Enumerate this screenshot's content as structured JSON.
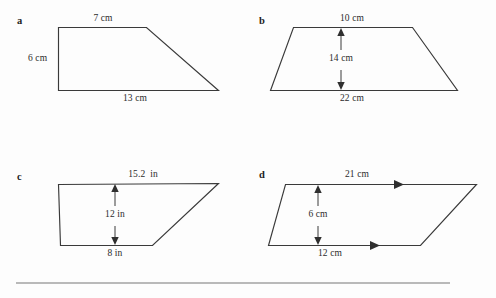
{
  "page": {
    "background_color": "#fdfdfd",
    "stroke_color": "#3a3a3a",
    "rule_color": "#b9b9b9"
  },
  "figures": [
    {
      "key": "a",
      "letter": "a",
      "shape_type": "trapezoid",
      "description": "right trapezoid with vertical left side",
      "labels": {
        "top": "7 cm",
        "left": "6 cm",
        "bottom": "13 cm"
      },
      "measurements": [
        {
          "name": "top-side",
          "value": 7,
          "unit": "cm",
          "text": "7 cm"
        },
        {
          "name": "left-side",
          "value": 6,
          "unit": "cm",
          "text": "6 cm"
        },
        {
          "name": "bottom-side",
          "value": 13,
          "unit": "cm",
          "text": "13 cm"
        }
      ]
    },
    {
      "key": "b",
      "letter": "b",
      "shape_type": "trapezoid",
      "description": "isosceles trapezoid with interior height arrow",
      "labels": {
        "top": "10 cm",
        "height": "14 cm",
        "bottom": "22 cm"
      },
      "measurements": [
        {
          "name": "top-side",
          "value": 10,
          "unit": "cm",
          "text": "10 cm"
        },
        {
          "name": "height",
          "value": 14,
          "unit": "cm",
          "text": "14 cm"
        },
        {
          "name": "bottom-side",
          "value": 22,
          "unit": "cm",
          "text": "22 cm"
        }
      ]
    },
    {
      "key": "c",
      "letter": "c",
      "shape_type": "trapezoid",
      "description": "trapezoid with long top side and interior height arrow",
      "labels": {
        "top": "15.2  in",
        "height": "12 in",
        "bottom": "8 in"
      },
      "measurements": [
        {
          "name": "top-side",
          "value": 15.2,
          "unit": "in",
          "text": "15.2  in"
        },
        {
          "name": "height",
          "value": 12,
          "unit": "in",
          "text": "12 in"
        },
        {
          "name": "bottom-side",
          "value": 8,
          "unit": "in",
          "text": "8 in"
        }
      ]
    },
    {
      "key": "d",
      "letter": "d",
      "shape_type": "parallelogram",
      "description": "parallelogram with parallel marks on top and bottom sides",
      "labels": {
        "top": "21 cm",
        "height": "6 cm",
        "bottom": "12 cm"
      },
      "measurements": [
        {
          "name": "top-side",
          "value": 21,
          "unit": "cm",
          "text": "21 cm"
        },
        {
          "name": "height",
          "value": 6,
          "unit": "cm",
          "text": "6 cm"
        },
        {
          "name": "bottom-side",
          "value": 12,
          "unit": "cm",
          "text": "12 cm"
        }
      ]
    }
  ]
}
